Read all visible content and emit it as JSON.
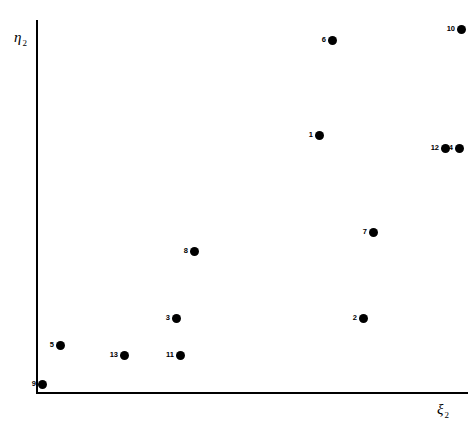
{
  "chart_data": {
    "type": "scatter",
    "title": "",
    "xlabel": "ξ",
    "xlabel_sub": "2",
    "ylabel": "η",
    "ylabel_sub": "2",
    "grid": false,
    "legend": "none",
    "axis_style": "two-sided-open (left and bottom spines only, no ticks, no tick labels)",
    "xlim": [
      0,
      1
    ],
    "ylim": [
      0,
      1
    ],
    "point_count": 13,
    "point_labels_position": "left of marker",
    "marker": {
      "shape": "circle",
      "color": "#000000",
      "size_px": 9
    },
    "points": [
      {
        "label": "1",
        "px": 319,
        "py": 135,
        "x": 0.654,
        "y": 0.69
      },
      {
        "label": "2",
        "px": 363,
        "py": 318,
        "x": 0.757,
        "y": 0.199
      },
      {
        "label": "3",
        "px": 176,
        "py": 318,
        "x": 0.322,
        "y": 0.199
      },
      {
        "label": "4",
        "px": 459,
        "py": 148,
        "x": 0.98,
        "y": 0.656
      },
      {
        "label": "5",
        "px": 60,
        "py": 345,
        "x": 0.056,
        "y": 0.126
      },
      {
        "label": "6",
        "px": 332,
        "py": 40,
        "x": 0.685,
        "y": 0.945
      },
      {
        "label": "7",
        "px": 373,
        "py": 232,
        "x": 0.78,
        "y": 0.431
      },
      {
        "label": "8",
        "px": 194,
        "py": 251,
        "x": 0.364,
        "y": 0.38
      },
      {
        "label": "9",
        "px": 42,
        "py": 384,
        "x": 0.014,
        "y": 0.024
      },
      {
        "label": "10",
        "px": 461,
        "py": 29,
        "x": 0.984,
        "y": 0.975
      },
      {
        "label": "11",
        "px": 180,
        "py": 355,
        "x": 0.331,
        "y": 0.099
      },
      {
        "label": "12",
        "px": 445,
        "py": 148,
        "x": 0.948,
        "y": 0.656
      },
      {
        "label": "13",
        "px": 124,
        "py": 355,
        "x": 0.204,
        "y": 0.099
      }
    ]
  },
  "axes": {
    "y_symbol": "η",
    "y_subscript": "2",
    "x_symbol": "ξ",
    "x_subscript": "2"
  }
}
